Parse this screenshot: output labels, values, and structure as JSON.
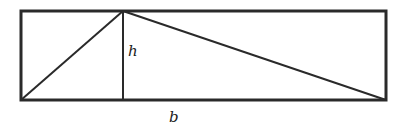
{
  "diagram": {
    "type": "geometry",
    "colors": {
      "stroke": "#2a2a2a",
      "background": "#ffffff",
      "text": "#222222"
    },
    "rectangle": {
      "x1": 21,
      "y1": 11,
      "x2": 386,
      "y2": 100
    },
    "triangle": {
      "apex": [
        123,
        11
      ],
      "base_left": [
        21,
        100
      ],
      "base_right": [
        386,
        100
      ]
    },
    "height_line": {
      "x": 123,
      "y1": 11,
      "y2": 100
    },
    "labels": {
      "height": "h",
      "base": "b"
    }
  }
}
